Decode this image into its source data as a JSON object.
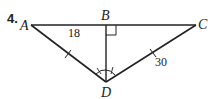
{
  "problem_number": "4.",
  "points": {
    "A": {
      "label": "A",
      "x": 31,
      "y": 25
    },
    "B": {
      "label": "B",
      "x": 106,
      "y": 25
    },
    "C": {
      "label": "C",
      "x": 196,
      "y": 25
    },
    "D": {
      "label": "D",
      "x": 106,
      "y": 82
    }
  },
  "segment_labels": {
    "AB": "18",
    "CD": "30"
  },
  "marks": {
    "right_angle_at": "B",
    "congruent_segments": [
      "AD",
      "CD"
    ],
    "congruent_angles_at_D": [
      "ADB",
      "BDC"
    ]
  }
}
